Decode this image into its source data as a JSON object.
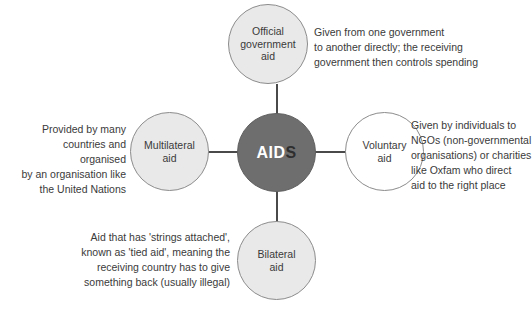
{
  "diagram": {
    "center": {
      "name": "aid-hub",
      "text_primary": "AID",
      "text_secondary": "S",
      "full_text": "AIDS",
      "fill_color": "#6e6e6e",
      "text_color": "#ffffff"
    },
    "nodes": [
      {
        "id": "official",
        "label": "Official\ngovernment\naid",
        "fill_color": "#e9e9e9",
        "border_color": "#8c8c8c",
        "position": "top"
      },
      {
        "id": "multilateral",
        "label": "Multilateral\naid",
        "fill_color": "#e9e9e9",
        "border_color": "#8c8c8c",
        "position": "left"
      },
      {
        "id": "voluntary",
        "label": "Voluntary\naid",
        "fill_color": "#ffffff",
        "border_color": "#8c8c8c",
        "position": "right"
      },
      {
        "id": "bilateral",
        "label": "Bilateral\naid",
        "fill_color": "#e9e9e9",
        "border_color": "#8c8c8c",
        "position": "bottom"
      }
    ],
    "captions": {
      "official": "Given from one government\nto another directly; the receiving\ngovernment then controls spending",
      "multilateral": "Provided by many\ncountries and organised\nby an organisation like\nthe United Nations",
      "voluntary": "Given by individuals to\nNGOs (non-governmental\norganisations) or charities\nlike Oxfam who direct\naid to the right place",
      "bilateral": "Aid that has 'strings attached',\nknown as 'tied aid', meaning the\nreceiving country has to give\nsomething back (usually illegal)"
    },
    "connector_color": "#4a4a4a",
    "background_color": "#ffffff"
  }
}
